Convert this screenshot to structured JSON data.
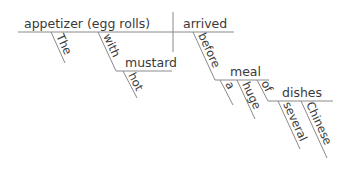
{
  "diagram": {
    "type": "sentence-diagram",
    "subject": "appetizer (egg rolls)",
    "verb": "arrived",
    "modifiers": {
      "the": "The",
      "with": "with",
      "mustard": "mustard",
      "hot": "hot",
      "before": "before",
      "meal": "meal",
      "a": "a",
      "huge": "huge",
      "of": "of",
      "dishes": "dishes",
      "several": "several",
      "chinese": "Chinese"
    },
    "colors": {
      "line": "#8a8a8a",
      "text": "#3a3a3a"
    }
  }
}
